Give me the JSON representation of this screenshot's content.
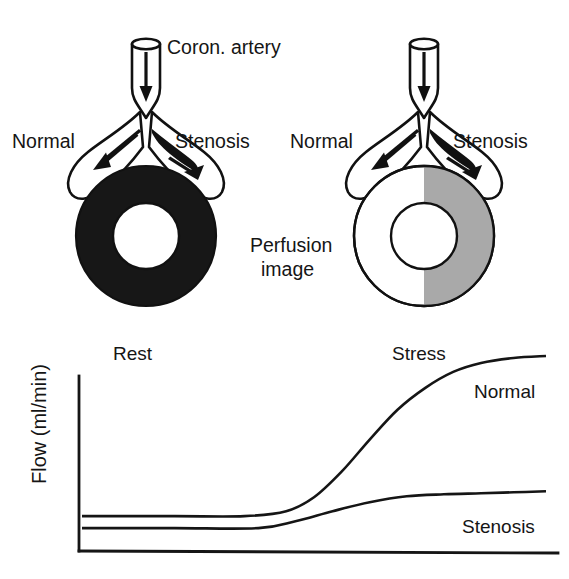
{
  "figure": {
    "title_semantic": "coronary-flow-reserve-diagram",
    "panels": [
      {
        "id": "rest-panel",
        "state": "rest",
        "artery_label": "Coron. artery",
        "left_branch_label": "Normal",
        "right_branch_label": "Stenosis",
        "perfusion_ring_fill": "uniform-black",
        "ring_colors": {
          "normal_sector": "#171717",
          "stenosis_sector": "#171717"
        }
      },
      {
        "id": "stress-panel",
        "state": "stress",
        "left_branch_label": "Normal",
        "right_branch_label": "Stenosis",
        "perfusion_ring_fill": "half-gray-defect",
        "ring_colors": {
          "normal_sector": "#ffffff",
          "stenosis_sector": "#a9a9a9"
        }
      }
    ],
    "perfusion_caption_line1": "Perfusion",
    "perfusion_caption_line2": "image"
  },
  "chart_data": {
    "type": "line",
    "title": "",
    "xlabel": "",
    "ylabel": "Flow (ml/min)",
    "grid": false,
    "legend_position": "inline-right",
    "x_annotations": [
      {
        "label": "Rest",
        "x_frac": 0.12
      },
      {
        "label": "Stress",
        "x_frac": 0.7
      }
    ],
    "series": [
      {
        "name": "Normal",
        "label_x_frac": 0.86,
        "label_y_frac": 0.78,
        "x": [
          0.0,
          0.2,
          0.35,
          0.44,
          0.5,
          0.56,
          0.62,
          0.68,
          0.74,
          0.8,
          0.86,
          0.93,
          1.0
        ],
        "y": [
          0.175,
          0.175,
          0.175,
          0.2,
          0.27,
          0.4,
          0.56,
          0.71,
          0.82,
          0.9,
          0.945,
          0.97,
          0.98
        ]
      },
      {
        "name": "Stenosis",
        "label_x_frac": 0.84,
        "label_y_frac": 0.165,
        "x": [
          0.0,
          0.2,
          0.38,
          0.46,
          0.54,
          0.62,
          0.7,
          0.78,
          0.86,
          0.93,
          1.0
        ],
        "y": [
          0.115,
          0.115,
          0.115,
          0.15,
          0.2,
          0.245,
          0.275,
          0.285,
          0.29,
          0.295,
          0.3
        ]
      }
    ],
    "axis_ranges": {
      "x": [
        0,
        1
      ],
      "y": [
        0,
        1
      ]
    },
    "axis_ticks_visible": false
  }
}
